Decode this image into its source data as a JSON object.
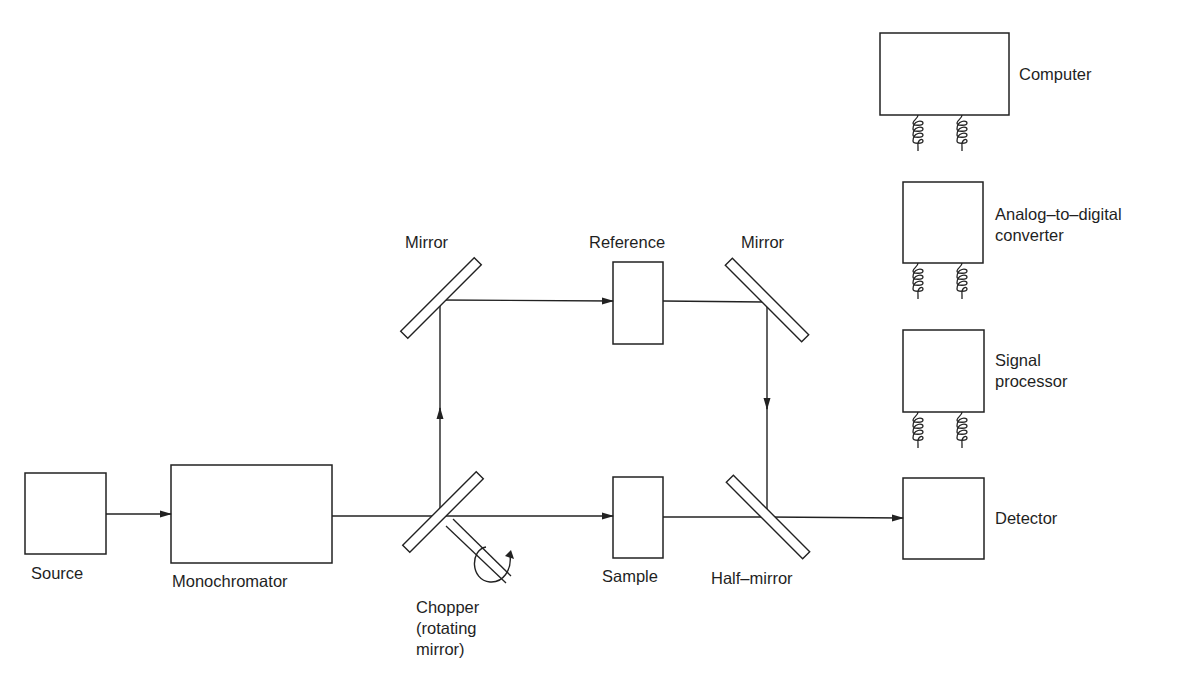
{
  "diagram": {
    "colors": {
      "line": "#222222",
      "background": "#ffffff",
      "text": "#1f1f1f"
    },
    "components": {
      "source": {
        "label": "Source"
      },
      "monochromator": {
        "label": "Monochromator"
      },
      "chopper": {
        "label_line1": "Chopper",
        "label_line2": "(rotating",
        "label_line3": "mirror)"
      },
      "mirror_left": {
        "label": "Mirror"
      },
      "reference": {
        "label": "Reference"
      },
      "mirror_right": {
        "label": "Mirror"
      },
      "sample": {
        "label": "Sample"
      },
      "half_mirror": {
        "label": "Half–mirror"
      },
      "computer": {
        "label": "Computer"
      },
      "adc": {
        "label_line1": "Analog–to–digital",
        "label_line2": "converter"
      },
      "signal_processor": {
        "label_line1": "Signal",
        "label_line2": "processor"
      },
      "detector": {
        "label": "Detector"
      }
    },
    "connections": [
      {
        "from": "Source",
        "to": "Monochromator",
        "type": "arrow"
      },
      {
        "from": "Monochromator",
        "to": "Chopper",
        "type": "line"
      },
      {
        "from": "Chopper",
        "to": "Mirror (left)",
        "type": "arrow"
      },
      {
        "from": "Mirror (left)",
        "to": "Reference",
        "type": "arrow"
      },
      {
        "from": "Reference",
        "to": "Mirror (right)",
        "type": "line"
      },
      {
        "from": "Mirror (right)",
        "to": "Half-mirror",
        "type": "arrow"
      },
      {
        "from": "Chopper",
        "to": "Sample",
        "type": "arrow"
      },
      {
        "from": "Sample",
        "to": "Half-mirror",
        "type": "line"
      },
      {
        "from": "Half-mirror",
        "to": "Detector",
        "type": "arrow"
      },
      {
        "from": "Detector",
        "to": "Signal processor",
        "type": "coiled-cable"
      },
      {
        "from": "Signal processor",
        "to": "Analog-to-digital converter",
        "type": "coiled-cable"
      },
      {
        "from": "Analog-to-digital converter",
        "to": "Computer",
        "type": "coiled-cable"
      }
    ]
  }
}
